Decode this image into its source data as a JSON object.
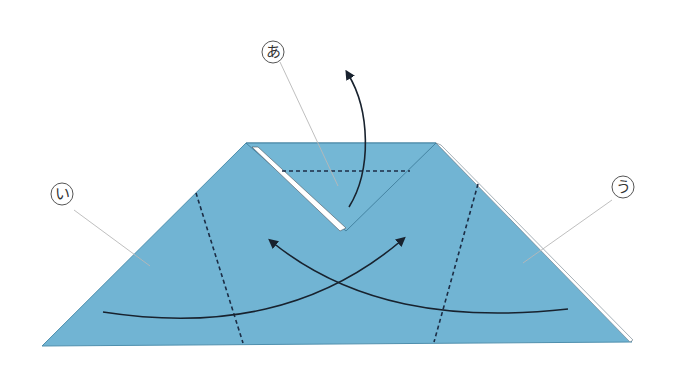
{
  "diagram": {
    "type": "origami-fold-instructions",
    "colors": {
      "paper": "#71b4d3",
      "paper_edge": "#4f8fad",
      "fold_line": "#1c2d45",
      "arrow": "#18222e",
      "leader_line": "#b8b8b8",
      "label_circle": "#555555",
      "inner_flap_edge": "#ffffff"
    },
    "paper": {
      "shape": "trapezoid",
      "vertices": [
        [
          246,
          143
        ],
        [
          436,
          143
        ],
        [
          632,
          342
        ],
        [
          42,
          346
        ]
      ]
    },
    "labels": [
      {
        "id": "a",
        "text": "あ",
        "cx": 273,
        "cy": 52,
        "r": 11,
        "leader_to": [
          338,
          186
        ]
      },
      {
        "id": "i",
        "text": "い",
        "cx": 62,
        "cy": 194,
        "r": 11,
        "leader_to": [
          150,
          266
        ]
      },
      {
        "id": "u",
        "text": "う",
        "cx": 623,
        "cy": 187,
        "r": 11,
        "leader_to": [
          523,
          263
        ]
      }
    ],
    "fold_lines": [
      {
        "name": "valley-fold-top",
        "from": [
          282,
          171
        ],
        "to": [
          410,
          171
        ]
      },
      {
        "name": "valley-fold-left",
        "from": [
          196,
          193
        ],
        "to": [
          243,
          343
        ]
      },
      {
        "name": "valley-fold-right",
        "from": [
          478,
          184
        ],
        "to": [
          434,
          342
        ]
      }
    ],
    "arrows": [
      {
        "name": "fold-up-arrow",
        "target_label": "あ",
        "direction": "up"
      },
      {
        "name": "fold-left-to-right-arrow",
        "target_label": "い",
        "direction": "up-right"
      },
      {
        "name": "fold-right-to-left-arrow",
        "target_label": "う",
        "direction": "up-left"
      }
    ]
  }
}
